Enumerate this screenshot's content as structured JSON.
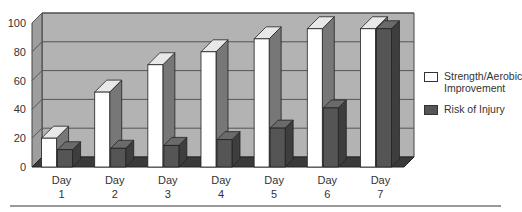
{
  "chart_data": {
    "type": "bar",
    "style": "3d-clustered-column",
    "title": "",
    "xlabel": "",
    "ylabel": "",
    "ylim": [
      0,
      100
    ],
    "yticks": [
      0,
      20,
      40,
      60,
      80,
      100
    ],
    "grid": true,
    "legend_position": "right",
    "categories": [
      "Day 1",
      "Day 2",
      "Day 3",
      "Day 4",
      "Day 5",
      "Day 6",
      "Day 7"
    ],
    "category_lines": [
      [
        "Day",
        "1"
      ],
      [
        "Day",
        "2"
      ],
      [
        "Day",
        "3"
      ],
      [
        "Day",
        "4"
      ],
      [
        "Day",
        "5"
      ],
      [
        "Day",
        "6"
      ],
      [
        "Day",
        "7"
      ]
    ],
    "series": [
      {
        "name": "Strength/Aerobic Improvement",
        "color": "#ffffff",
        "values": [
          20,
          52,
          71,
          80,
          89,
          96,
          96
        ]
      },
      {
        "name": "Risk of Injury",
        "color": "#555555",
        "values": [
          12,
          13,
          15,
          19,
          27,
          41,
          96
        ]
      }
    ]
  },
  "legend": {
    "items": [
      {
        "label_line1": "Strength/Aerobic",
        "label_line2": "Improvement",
        "color": "#ffffff"
      },
      {
        "label_line1": "Risk of Injury",
        "label_line2": "",
        "color": "#555555"
      }
    ]
  },
  "colors": {
    "wall": "#b3b3b3",
    "floor": "#3a3a3a",
    "grid": "#555555",
    "axis_text": "#333333"
  }
}
